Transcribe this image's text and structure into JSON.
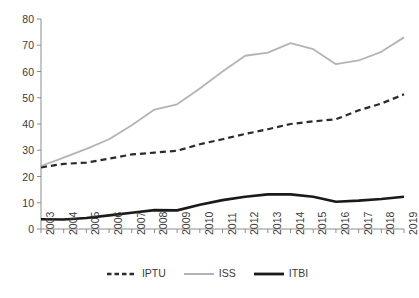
{
  "chart_data": {
    "type": "line",
    "title": "",
    "subtitle": "",
    "xlabel": "",
    "ylabel": "",
    "x": [
      "2003",
      "2004",
      "2005",
      "2006",
      "2007",
      "2008",
      "2009",
      "2010",
      "2011",
      "2012",
      "2013",
      "2014",
      "2015",
      "2016",
      "2017",
      "2018",
      "2019"
    ],
    "categories": [
      "2003",
      "2004",
      "2005",
      "2006",
      "2007",
      "2008",
      "2009",
      "2010",
      "2011",
      "2012",
      "2013",
      "2014",
      "2015",
      "2016",
      "2017",
      "2018",
      "2019"
    ],
    "series": [
      {
        "name": "IPTU",
        "color": "#2b2b2b",
        "style": "dashed",
        "width": 2.2,
        "values": [
          23.5,
          24.8,
          25.3,
          26.8,
          28.4,
          29.1,
          29.8,
          32.3,
          34.2,
          36.2,
          38.0,
          40.0,
          41.0,
          41.8,
          45.2,
          47.8,
          51.3
        ]
      },
      {
        "name": "ISS",
        "color": "#b4b4b4",
        "style": "solid",
        "width": 1.8,
        "values": [
          24.0,
          27.2,
          30.5,
          34.2,
          39.5,
          45.5,
          47.5,
          53.5,
          60.0,
          66.0,
          67.2,
          70.8,
          68.5,
          62.8,
          64.2,
          67.5,
          73.0
        ]
      },
      {
        "name": "ITBI",
        "color": "#1a1a1a",
        "style": "solid",
        "width": 2.6,
        "values": [
          3.7,
          3.6,
          4.2,
          5.2,
          6.2,
          7.2,
          7.1,
          9.2,
          11.0,
          12.3,
          13.2,
          13.2,
          12.3,
          10.4,
          10.8,
          11.4,
          12.3
        ]
      }
    ],
    "yticks": [
      0,
      10,
      20,
      30,
      40,
      50,
      60,
      70,
      80
    ],
    "ylim": [
      0,
      80
    ],
    "xlim_index": [
      0,
      16
    ],
    "grid": false,
    "legend": {
      "position": "bottom",
      "entries": [
        {
          "label": "IPTU",
          "color": "#2b2b2b",
          "style": "dashed"
        },
        {
          "label": "ISS",
          "color": "#b4b4b4",
          "style": "solid"
        },
        {
          "label": "ITBI",
          "color": "#1a1a1a",
          "style": "solid"
        }
      ]
    },
    "axis_color": "#8c8c8c",
    "tick_label_color": "#3a3a3a"
  }
}
